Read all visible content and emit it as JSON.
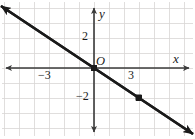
{
  "figure": {
    "background_color": "#ffffff"
  },
  "labels": {
    "x_axis": "x",
    "y_axis": "y",
    "origin": "O",
    "x_tick_negative": "−3",
    "x_tick_positive": "3",
    "y_tick_positive": "2",
    "y_tick_negative": "−2"
  },
  "colors": {
    "grid": "#d8d6d4",
    "axis": "#3a3a3a",
    "line": "#1a1a1a",
    "point": "#1a1a1a",
    "text": "#1a1a1a"
  },
  "chart_data": {
    "type": "line",
    "title": "",
    "xlabel": "x",
    "ylabel": "y",
    "xlim": [
      -6.2,
      6.6
    ],
    "ylim": [
      -4.6,
      4.6
    ],
    "grid": true,
    "grid_step": 1,
    "legend": "none",
    "x_ticks": [
      -3,
      3
    ],
    "x_tick_labels": [
      "−3",
      "3"
    ],
    "y_ticks": [
      2,
      -2
    ],
    "y_tick_labels": [
      "2",
      "−2"
    ],
    "origin_label": "O",
    "series": [
      {
        "name": "y = -2/3 x",
        "slope": -0.6667,
        "intercept": 0,
        "equation": "y = -2/3 x",
        "x": [
          -6.2,
          6.6
        ],
        "y": [
          4.13,
          -4.4
        ],
        "arrow_both_ends": true,
        "color": "#1a1a1a"
      }
    ],
    "points": [
      {
        "x": -3,
        "y": 2,
        "label": ""
      },
      {
        "x": 0,
        "y": 0,
        "label": ""
      },
      {
        "x": 3,
        "y": -2,
        "label": ""
      }
    ]
  }
}
